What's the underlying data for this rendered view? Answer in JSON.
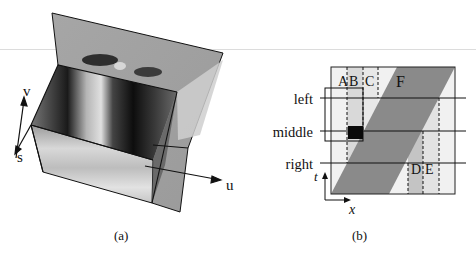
{
  "figure": {
    "panel_a": {
      "caption": "(a)",
      "axes": {
        "v": "v",
        "s": "s",
        "u": "u"
      },
      "description": "3D volume rendering of spatiotemporal image cube with axes u, v, s"
    },
    "panel_b": {
      "caption": "(b)",
      "row_labels": {
        "left": "left",
        "middle": "middle",
        "right": "right"
      },
      "region_labels": {
        "A": "A",
        "B": "B",
        "C": "C",
        "D": "D",
        "E": "E",
        "F": "F"
      },
      "axes": {
        "t": "t",
        "x": "x"
      }
    },
    "colors": {
      "band_dark": "#8a8a8a",
      "band_light_gray": "#d4d4d4",
      "band_lighter": "#e6e6e6",
      "background_panel": "#f1f1f1",
      "line": "#111111"
    }
  }
}
